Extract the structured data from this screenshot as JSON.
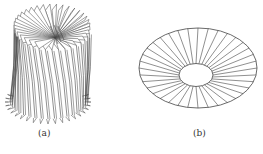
{
  "figure": {
    "panels": [
      {
        "id": "a",
        "label": "(a)",
        "description": "3D twisted radial fin cylinder (folded sheet fins)",
        "fin_count": 36
      },
      {
        "id": "b",
        "label": "(b)",
        "description": "Flat annular disk with radial spokes",
        "spoke_count": 36
      }
    ],
    "stroke_color": "#444444",
    "background": "#ffffff"
  }
}
